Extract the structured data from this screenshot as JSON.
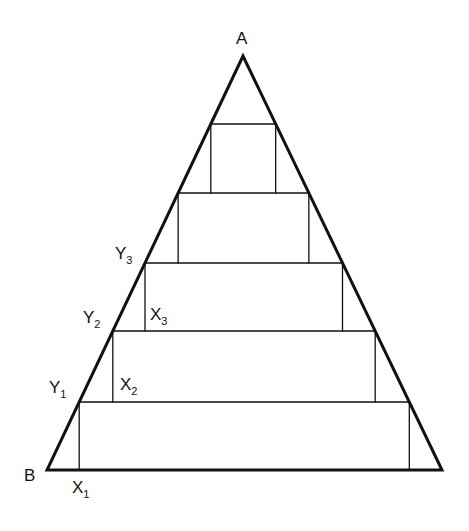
{
  "diagram": {
    "type": "triangle-with-inscribed-stacked-rectangles",
    "stroke_color": "#111111",
    "background": "#ffffff",
    "triangle": {
      "apex": {
        "label": "A",
        "x": 243,
        "y": 56
      },
      "base_left": {
        "label": "B",
        "x": 47,
        "y": 470
      },
      "base_right": {
        "x": 442,
        "y": 470
      }
    },
    "levels_y": [
      124,
      193,
      263,
      331,
      402,
      470
    ],
    "labels": [
      {
        "id": "A",
        "text": "A",
        "sub": "",
        "x": 236,
        "y": 44
      },
      {
        "id": "B",
        "text": "B",
        "sub": "",
        "x": 24,
        "y": 481
      },
      {
        "id": "Y3",
        "text": "Y",
        "sub": "3",
        "x": 115,
        "y": 259
      },
      {
        "id": "Y2",
        "text": "Y",
        "sub": "2",
        "x": 83,
        "y": 323
      },
      {
        "id": "Y1",
        "text": "Y",
        "sub": "1",
        "x": 49,
        "y": 393
      },
      {
        "id": "X3",
        "text": "X",
        "sub": "3",
        "x": 150,
        "y": 320
      },
      {
        "id": "X2",
        "text": "X",
        "sub": "2",
        "x": 120,
        "y": 390
      },
      {
        "id": "X1",
        "text": "X",
        "sub": "1",
        "x": 72,
        "y": 493
      }
    ]
  }
}
